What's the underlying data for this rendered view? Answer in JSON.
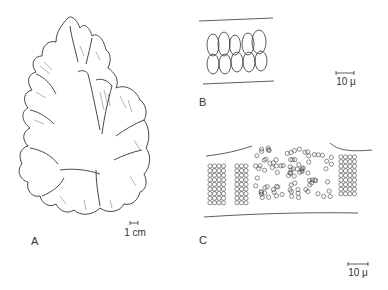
{
  "figure": {
    "panels": [
      {
        "id": "A",
        "label": "A",
        "subject": "whole thallus with ruffled lobed margins",
        "scale_bar": "1 cm"
      },
      {
        "id": "B",
        "label": "B",
        "subject": "cross-section showing paired elongate cells",
        "scale_bar": "10 μ"
      },
      {
        "id": "C",
        "label": "C",
        "subject": "cross-section with cells in regular packets and scattered cells",
        "scale_bar": "10 μ"
      }
    ],
    "colors": {
      "line": "#333333",
      "background": "#ffffff"
    }
  }
}
